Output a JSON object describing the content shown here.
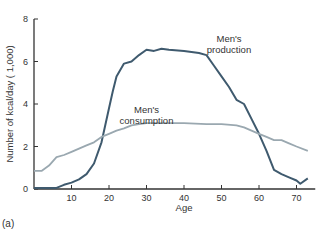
{
  "chart_data": {
    "type": "line",
    "title": "",
    "panel_label": "(a)",
    "xlabel": "Age",
    "ylabel": "Number of kcal/day ( 1,000)",
    "xlim": [
      0,
      75
    ],
    "ylim": [
      0,
      8
    ],
    "xticks": [
      10,
      20,
      30,
      40,
      50,
      60,
      70
    ],
    "yticks": [
      0,
      2,
      4,
      6,
      8
    ],
    "grid": false,
    "legend": "inline annotations",
    "series": [
      {
        "name": "Men's production",
        "color": "#3f5a6e",
        "x": [
          0,
          6,
          8,
          10,
          12,
          14,
          16,
          18,
          20,
          21,
          22,
          24,
          26,
          28,
          30,
          32,
          34,
          36,
          40,
          44,
          46,
          48,
          50,
          52,
          54,
          56,
          58,
          60,
          62,
          64,
          66,
          68,
          70,
          71,
          73
        ],
        "y": [
          0.05,
          0.05,
          0.2,
          0.3,
          0.45,
          0.7,
          1.2,
          2.2,
          3.8,
          4.6,
          5.3,
          5.9,
          6.0,
          6.3,
          6.55,
          6.5,
          6.6,
          6.55,
          6.5,
          6.4,
          6.3,
          5.8,
          5.3,
          4.8,
          4.2,
          4.0,
          3.3,
          2.6,
          1.8,
          0.9,
          0.7,
          0.55,
          0.4,
          0.25,
          0.5
        ]
      },
      {
        "name": "Men's consumption",
        "color": "#9aa8b0",
        "x": [
          0,
          2,
          4,
          6,
          8,
          10,
          12,
          14,
          16,
          18,
          20,
          22,
          24,
          26,
          28,
          30,
          40,
          46,
          50,
          54,
          56,
          58,
          60,
          62,
          64,
          66,
          68,
          70,
          73
        ],
        "y": [
          0.85,
          0.85,
          1.1,
          1.5,
          1.6,
          1.75,
          1.9,
          2.05,
          2.2,
          2.45,
          2.6,
          2.75,
          2.85,
          3.0,
          3.05,
          3.1,
          3.1,
          3.05,
          3.05,
          3.0,
          2.9,
          2.75,
          2.6,
          2.45,
          2.3,
          2.3,
          2.15,
          2.0,
          1.8
        ]
      }
    ],
    "annotations": [
      {
        "text": [
          "Men's",
          "production"
        ],
        "x": 52,
        "y": 6.9
      },
      {
        "text": [
          "Men's",
          "consumption"
        ],
        "x": 30,
        "y": 3.6
      }
    ]
  }
}
